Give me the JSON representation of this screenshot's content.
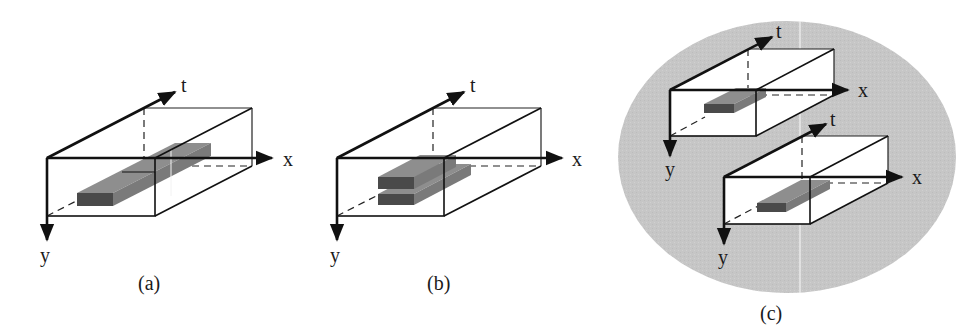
{
  "figure": {
    "panels": [
      {
        "id": "a",
        "caption": "(a)",
        "axes": {
          "x": "x",
          "y": "y",
          "t": "t"
        },
        "description": "Single spatio-temporal tube (elongated bar) inside an x-y-t volume"
      },
      {
        "id": "b",
        "caption": "(b)",
        "axes": {
          "x": "x",
          "y": "y",
          "t": "t"
        },
        "description": "Two stacked short tubes inside an x-y-t volume"
      },
      {
        "id": "c",
        "caption": "(c)",
        "axes_top": {
          "x": "x",
          "y": "y",
          "t": "t"
        },
        "axes_bottom": {
          "x": "x",
          "y": "y",
          "t": "t"
        },
        "description": "Two separate x-y-t volumes each with a tube, on a gray elliptical background"
      }
    ],
    "colors": {
      "background": "#ffffff",
      "ellipse": "#c6c6c6",
      "bar_front": "#4a4a4a",
      "bar_top": "#8a8a8a",
      "bar_side": "#777777",
      "line": "#111111"
    }
  }
}
